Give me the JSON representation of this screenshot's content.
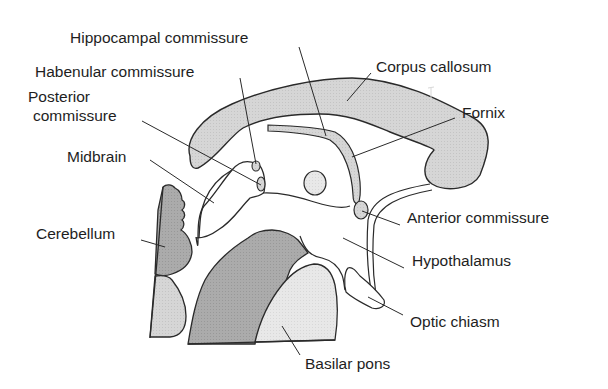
{
  "diagram": {
    "type": "anatomical-sagittal-section",
    "colors": {
      "background": "#ffffff",
      "outline": "#2a2a2a",
      "light_fill": "#d4d4d4",
      "dark_fill": "#a8a8a8",
      "very_light_fill": "#e6e6e6",
      "text": "#1e1e1e"
    },
    "labels": [
      {
        "id": "hippocampal-commissure",
        "text": "Hippocampal commissure"
      },
      {
        "id": "habenular-commissure",
        "text": "Habenular commissure"
      },
      {
        "id": "posterior-commissure-line1",
        "text": "Posterior"
      },
      {
        "id": "posterior-commissure-line2",
        "text": "commissure"
      },
      {
        "id": "midbrain",
        "text": "Midbrain"
      },
      {
        "id": "cerebellum",
        "text": "Cerebellum"
      },
      {
        "id": "corpus-callosum",
        "text": "Corpus callosum"
      },
      {
        "id": "fornix",
        "text": "Fornix"
      },
      {
        "id": "anterior-commissure",
        "text": "Anterior commissure"
      },
      {
        "id": "hypothalamus",
        "text": "Hypothalamus"
      },
      {
        "id": "optic-chiasm",
        "text": "Optic chiasm"
      },
      {
        "id": "basilar-pons",
        "text": "Basilar pons"
      }
    ]
  }
}
